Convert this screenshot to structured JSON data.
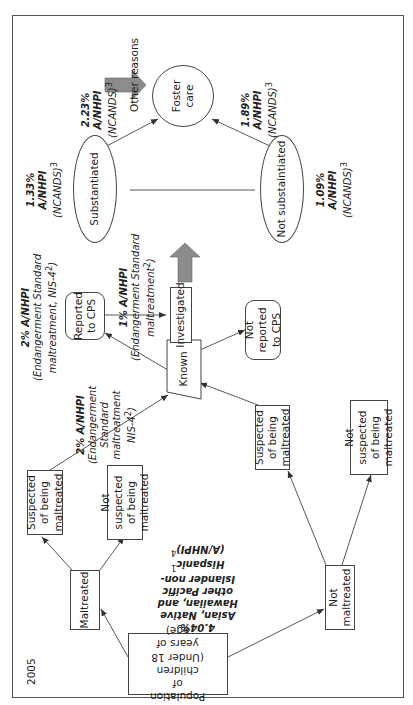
{
  "diagram": {
    "year": "2005",
    "nodes": {
      "population": "Population of children (Under 18 years of age)",
      "maltreated": "Maltreated",
      "not_maltreated": "Not maltreated",
      "suspected_top": "Suspected of being maltreated",
      "not_suspected_top": "Not suspected of being maltreated",
      "suspected_bottom": "Suspected of being maltreated",
      "not_suspected_bottom": "Not suspected of being maltreated",
      "known": "Known",
      "reported": "Reported to CPS",
      "not_reported": "Not reported to CPS",
      "investigated": "Investigated",
      "substantiated": "Substantiated",
      "not_substantiated": "Not substaintiated",
      "foster_care": "Foster care",
      "other_reasons": "Other reasons"
    },
    "annotations": {
      "population_pct": "4.04%",
      "population_group": "Asian, Native Hawaiian, and other Pacific Islander non-Hispanic",
      "population_sup1": "1",
      "population_abbr": "(A/NHPI)",
      "population_sup2": "4",
      "known_pct": "2% A/NHPI",
      "known_source": "(Endangerment Standard maltreatment NIS-4",
      "known_sup": "2",
      "reported_pct": "2% A/NHPI",
      "reported_source": "(Endangerment Standard maltreatment, NIS-4",
      "reported_sup": "2",
      "investigated_pct": "1% A/NHPI",
      "investigated_source": "(Endangerment Standard maltreatment",
      "investigated_sup": "2",
      "substantiated_pct": "1.33%",
      "substantiated_group": "A/NHPI",
      "substantiated_source": "(NCANDS)",
      "substantiated_sup": "3",
      "not_substantiated_pct": "1.09%",
      "not_substantiated_group": "A/NHPI",
      "not_substantiated_source": "(NCANDS)",
      "not_substantiated_sup": "3",
      "foster_from_sub_pct": "2.23%",
      "foster_from_sub_group": "A/NHPI",
      "foster_from_sub_source": "(NCANDS)",
      "foster_from_sub_sup": "3",
      "foster_from_notsub_pct": "1.89%",
      "foster_from_notsub_group": "A/NHPI",
      "foster_from_notsub_source": "(NCANDS)",
      "foster_from_notsub_sup": "3"
    },
    "colors": {
      "line": "#444444",
      "block_arrow": "#8c8c8c"
    }
  }
}
